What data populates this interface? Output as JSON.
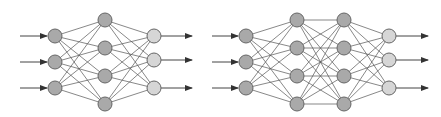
{
  "colors": {
    "background": "#ffffff",
    "edge": "#555555",
    "node_stroke": "#666666",
    "node_fill_dark": "#a9a9a9",
    "node_fill_light": "#d6d6d6",
    "arrow": "#444444"
  },
  "node_radius": 7,
  "networks": [
    {
      "name": "shallow-network",
      "arrow_in_start_x": 20,
      "arrow_out_end_x": 192,
      "layers": [
        {
          "role": "input",
          "x": 55,
          "ys": [
            36,
            62,
            88
          ],
          "fill": "dark"
        },
        {
          "role": "hidden",
          "x": 105,
          "ys": [
            20,
            48,
            76,
            104
          ],
          "fill": "dark"
        },
        {
          "role": "output",
          "x": 154,
          "ys": [
            36,
            60,
            88
          ],
          "fill": "light"
        }
      ]
    },
    {
      "name": "deep-network",
      "arrow_in_start_x": 212,
      "arrow_out_end_x": 428,
      "layers": [
        {
          "role": "input",
          "x": 246,
          "ys": [
            36,
            62,
            88
          ],
          "fill": "dark"
        },
        {
          "role": "hidden",
          "x": 297,
          "ys": [
            20,
            48,
            76,
            104
          ],
          "fill": "dark"
        },
        {
          "role": "hidden",
          "x": 344,
          "ys": [
            20,
            48,
            76,
            104
          ],
          "fill": "dark"
        },
        {
          "role": "output",
          "x": 389,
          "ys": [
            36,
            60,
            88
          ],
          "fill": "light"
        }
      ]
    }
  ]
}
